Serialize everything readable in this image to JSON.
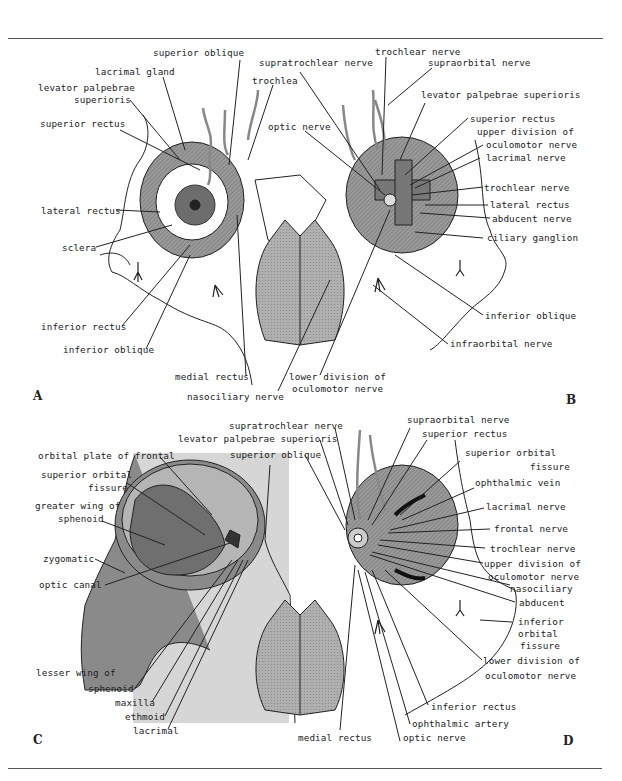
{
  "figure": {
    "panels": {
      "A": {
        "letter": "A",
        "labels": {
          "superior_oblique": "superior oblique",
          "lacrimal_gland": "lacrimal gland",
          "levator_1": "levator palpebrae",
          "levator_2": "superioris",
          "superior_rectus": "superior rectus",
          "trochlea": "trochlea",
          "lateral_rectus": "lateral rectus",
          "sclera": "sclera",
          "inferior_rectus": "inferior rectus",
          "inferior_oblique": "inferior oblique",
          "medial_rectus": "medial rectus",
          "nasociliary_nerve": "nasociliary nerve"
        }
      },
      "B": {
        "letter": "B",
        "labels": {
          "supratrochlear_nerve": "supratrochlear nerve",
          "trochlear_nerve_top": "trochlear nerve",
          "supraorbital_nerve": "supraorbital nerve",
          "levator": "levator palpebrae superioris",
          "optic_nerve": "optic nerve",
          "superior_rectus": "superior rectus",
          "upper_division_1": "upper division of",
          "upper_division_2": "oculomotor nerve",
          "lacrimal_nerve": "lacrimal nerve",
          "trochlear_nerve": "trochlear nerve",
          "lateral_rectus": "lateral rectus",
          "abducent_nerve": "abducent nerve",
          "ciliary_ganglion": "ciliary ganglion",
          "inferior_oblique": "inferior oblique",
          "infraorbital_nerve": "infraorbital nerve",
          "lower_division_1": "lower division of",
          "lower_division_2": "oculomotor nerve"
        }
      },
      "C": {
        "letter": "C",
        "labels": {
          "orbital_plate": "orbital plate of frontal",
          "sof_1": "superior orbital",
          "sof_2": "fissure",
          "greater_wing_1": "greater wing of",
          "greater_wing_2": "sphenoid",
          "zygomatic": "zygomatic",
          "optic_canal": "optic canal",
          "lesser_wing_1": "lesser wing of",
          "lesser_wing_2": "sphenoid",
          "maxilla": "maxilla",
          "ethmoid": "ethmoid",
          "lacrimal": "lacrimal"
        }
      },
      "D": {
        "letter": "D",
        "labels": {
          "supratrochlear_nerve": "supratrochlear nerve",
          "levator": "levator palpebrae superioris",
          "superior_oblique": "superior oblique",
          "supraorbital_nerve": "supraorbital nerve",
          "superior_rectus": "superior rectus",
          "sof_1": "superior orbital",
          "sof_2": "fissure",
          "ophthalmic_vein": "ophthalmic vein",
          "lacrimal_nerve": "lacrimal nerve",
          "frontal_nerve": "frontal nerve",
          "trochlear_nerve": "trochlear nerve",
          "upper_division_1": "upper division of",
          "upper_division_2": "oculomotor nerve",
          "nasociliary": "nasociliary",
          "abducent": "abducent",
          "iof_1": "inferior",
          "iof_2": "orbital",
          "iof_3": "fissure",
          "lower_division_1": "lower division of",
          "lower_division_2": "oculomotor nerve",
          "inferior_rectus": "inferior rectus",
          "ophthalmic_artery": "ophthalmic artery",
          "medial_rectus": "medial rectus",
          "optic_nerve": "optic nerve"
        }
      }
    },
    "colors": {
      "ink": "#222222",
      "muscle_gray": "#8a8a8a",
      "bone_dark": "#7a7a7a",
      "panel_c_shade": "#d6d6d6",
      "nasal_fill": "#a8a8a8"
    }
  }
}
